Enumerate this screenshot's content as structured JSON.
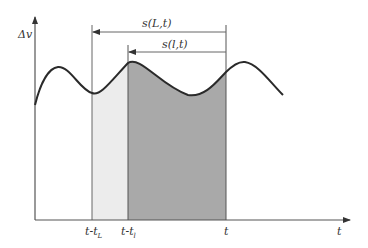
{
  "diagram": {
    "y_axis_label": "Δv",
    "x_axis_label": "t",
    "ticks": [
      {
        "base": "t-t",
        "sub": "L"
      },
      {
        "base": "t-t",
        "sub": "l"
      },
      {
        "base": "t",
        "sub": ""
      }
    ],
    "intervals": [
      {
        "label": "s(L,t)",
        "from_tick": "t-t_L",
        "to_tick": "t"
      },
      {
        "label": "s(l,t)",
        "from_tick": "t-t_l",
        "to_tick": "t"
      }
    ],
    "regions": [
      {
        "name": "long-window",
        "from": "t-t_L",
        "to": "t-t_l",
        "fill": "#ececec"
      },
      {
        "name": "short-window",
        "from": "t-t_l",
        "to": "t",
        "fill": "#a9a9a9"
      }
    ],
    "colors": {
      "axis": "#555555",
      "curve": "#2a2a2a",
      "light_fill": "#ececec",
      "dark_fill": "#a9a9a9"
    }
  }
}
